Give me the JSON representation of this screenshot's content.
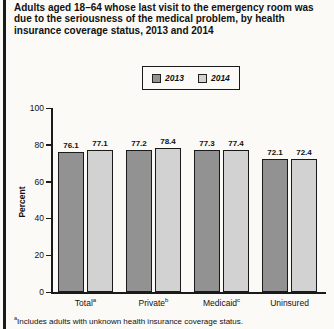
{
  "title": "Adults aged 18–64 whose last visit to the emergency room was due to the seriousness of the medical problem, by health insurance coverage status, 2013 and 2014",
  "legend": {
    "items": [
      {
        "label": "2013",
        "color": "#929292"
      },
      {
        "label": "2014",
        "color": "#d2d2d2"
      }
    ]
  },
  "chart_data": {
    "type": "bar",
    "categories": [
      "Total",
      "Private",
      "Medicaid",
      "Uninsured"
    ],
    "category_superscripts": [
      "a",
      "b",
      "c",
      ""
    ],
    "series": [
      {
        "name": "2013",
        "color": "#929292",
        "values": [
          76.1,
          77.2,
          77.3,
          72.1
        ]
      },
      {
        "name": "2014",
        "color": "#d2d2d2",
        "values": [
          77.1,
          78.4,
          77.4,
          72.4
        ]
      }
    ],
    "xlabel": "",
    "ylabel": "Percent",
    "ylim": [
      0,
      100
    ],
    "yticks": [
      0,
      20,
      40,
      60,
      80,
      100
    ],
    "grid": false,
    "legend_position": "top",
    "bar_border_color": "#1a1a1a"
  },
  "footnote": {
    "superscript": "a",
    "text": "Includes adults with unknown health insurance coverage status."
  }
}
